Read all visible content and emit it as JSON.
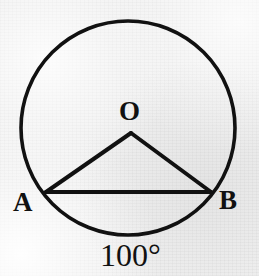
{
  "figure": {
    "kind": "circle-geometry-diagram",
    "background_color": "#eeeeee",
    "stroke_color": "#111111",
    "labels": {
      "center": "O",
      "left_point": "A",
      "right_point": "B",
      "angle": "100°"
    },
    "geometry": {
      "circle": {
        "cx": 128,
        "cy": 128,
        "r": 107,
        "stroke_width": 3.6
      },
      "center_point": {
        "x": 131,
        "y": 133
      },
      "point_a": {
        "x": 46,
        "y": 192
      },
      "point_b": {
        "x": 211,
        "y": 192
      },
      "radius_oa": {
        "x1": 131,
        "y1": 133,
        "x2": 46,
        "y2": 192
      },
      "radius_ob": {
        "x1": 131,
        "y1": 133,
        "x2": 211,
        "y2": 192
      },
      "chord_ab": {
        "x1": 46,
        "y1": 192,
        "x2": 211,
        "y2": 192
      },
      "line_stroke_width": 4
    }
  }
}
